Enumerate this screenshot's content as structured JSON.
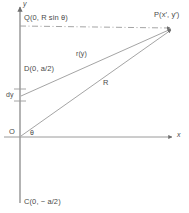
{
  "figure": {
    "background_color": "#ffffff",
    "line_color": "#8a8a8a",
    "text_color": "#4a4a4a",
    "axes": {
      "x_axis_label": "x",
      "y_axis_label": "y",
      "origin_label": "O",
      "angle_label": "θ"
    },
    "points": [
      {
        "id": "Q",
        "label": "Q(0, R sin θ)"
      },
      {
        "id": "P",
        "label": "P(x′, y′)"
      },
      {
        "id": "D",
        "label": "D(0, a/2)"
      },
      {
        "id": "O",
        "label": "O"
      },
      {
        "id": "C",
        "label": "C(0, − a/2)"
      }
    ],
    "segments": [
      {
        "id": "ry",
        "label": "r(y)"
      },
      {
        "id": "R",
        "label": "R"
      },
      {
        "id": "dy",
        "label": "dy"
      }
    ]
  }
}
